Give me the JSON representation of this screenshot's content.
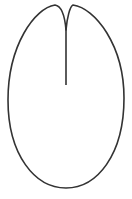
{
  "diagram": {
    "description": "Line drawing of an oval/leaf-like outline with a notch at the top and a vertical line descending into the interior",
    "stroke_color": "#333333",
    "background": "#ffffff",
    "stroke_width": 1.6,
    "outline_path": "M66,30 C65,18 62,6 55,5 C35,8 8,45 8,100 C8,155 35,188 66,188 C97,188 124,155 124,98 C124,45 95,8 73,5 C70,6 67,18 66,30 Z",
    "center_line": {
      "x1": 66,
      "y1": 28,
      "x2": 66,
      "y2": 85
    }
  }
}
